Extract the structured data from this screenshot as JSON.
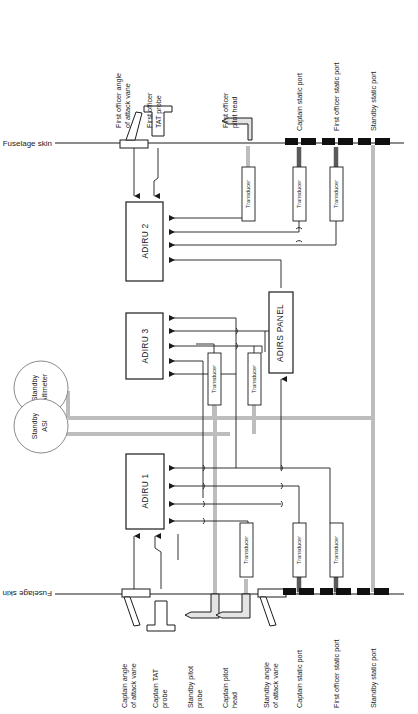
{
  "diagram": {
    "type": "block-schematic",
    "width": 418,
    "height": 714,
    "colors": {
      "line": "#1b1b1b",
      "pipe_gray": "#b8b8b8",
      "pipe_dark": "#5a5a5a",
      "port_black": "#101010",
      "background": "#ffffff"
    },
    "skin_label_top": "Fuselage skin",
    "skin_label_bottom": "Fuselage skin"
  },
  "units": [
    {
      "id": "adiru2",
      "label": "ADIRU 2",
      "x": 126,
      "y": 202,
      "w": 37,
      "h": 79
    },
    {
      "id": "adiru3",
      "label": "ADIRU 3",
      "x": 126,
      "y": 313,
      "w": 37,
      "h": 66
    },
    {
      "id": "adiru1",
      "label": "ADIRU 1",
      "x": 126,
      "y": 454,
      "w": 38,
      "h": 75
    },
    {
      "id": "adirs_panel",
      "label": "ADIRS PANEL",
      "x": 269,
      "y": 292,
      "w": 24,
      "h": 81
    }
  ],
  "standby_instruments": [
    {
      "id": "standby_altimeter",
      "line1": "Standby",
      "line2": "Altimeter",
      "cx": 41,
      "cy": 388,
      "r": 27
    },
    {
      "id": "standby_asi",
      "line1": "Standby",
      "line2": "ASI",
      "cx": 41,
      "cy": 426,
      "r": 27
    }
  ],
  "transducers": [
    {
      "id": "td_fo_pitot",
      "label": "Transducer",
      "x": 242,
      "y": 167,
      "w": 13,
      "h": 54
    },
    {
      "id": "td_capt_static_u",
      "label": "Transducer",
      "x": 293,
      "y": 167,
      "w": 13,
      "h": 54
    },
    {
      "id": "td_fo_static_u",
      "label": "Transducer",
      "x": 330,
      "y": 167,
      "w": 13,
      "h": 54
    },
    {
      "id": "td_mid_left",
      "label": "Transducer",
      "x": 208,
      "y": 353,
      "w": 13,
      "h": 52
    },
    {
      "id": "td_mid_right",
      "label": "Transducer",
      "x": 248,
      "y": 353,
      "w": 13,
      "h": 52
    },
    {
      "id": "td_capt_pitot_l",
      "label": "Transducer",
      "x": 240,
      "y": 523,
      "w": 13,
      "h": 54
    },
    {
      "id": "td_capt_static_l",
      "label": "Transducer",
      "x": 293,
      "y": 523,
      "w": 13,
      "h": 54
    },
    {
      "id": "td_fo_static_l",
      "label": "Transducer",
      "x": 330,
      "y": 523,
      "w": 13,
      "h": 54
    }
  ],
  "top_sensors": [
    {
      "id": "fo_aoa_vane",
      "line1": "First officer angle",
      "line2": "of attack vane",
      "lx": 121,
      "ly": 128,
      "two_line": true
    },
    {
      "id": "fo_tat_probe",
      "line1": "First officer",
      "line2": "TAT probe",
      "lx": 152,
      "ly": 128,
      "two_line": true
    },
    {
      "id": "fo_pitot_head",
      "line1": "First officer",
      "line2": "pitot head",
      "lx": 228,
      "ly": 128,
      "two_line": true
    },
    {
      "id": "capt_static_port_top",
      "line1": "Captain static port",
      "line2": "",
      "lx": 299,
      "ly": 128,
      "two_line": false
    },
    {
      "id": "fo_static_port_top",
      "line1": "First officer static port",
      "line2": "",
      "lx": 336,
      "ly": 128,
      "two_line": false
    },
    {
      "id": "standby_static_port_top",
      "line1": "Standby static port",
      "line2": "",
      "lx": 373,
      "ly": 128,
      "two_line": false
    }
  ],
  "bottom_sensors": [
    {
      "id": "capt_aoa_vane",
      "line1": "Captain angle",
      "line2": "of attack vane",
      "lx": 127,
      "ly": 612,
      "two_line": true
    },
    {
      "id": "capt_tat_probe",
      "line1": "Captain TAT",
      "line2": "probe",
      "lx": 158,
      "ly": 612,
      "two_line": true
    },
    {
      "id": "standby_pitot_probe",
      "line1": "Standby pitot",
      "line2": "probe",
      "lx": 193,
      "ly": 612,
      "two_line": true
    },
    {
      "id": "capt_pitot_head",
      "line1": "Captain pitot",
      "line2": "head",
      "lx": 228,
      "ly": 612,
      "two_line": true
    },
    {
      "id": "standby_aoa_vane",
      "line1": "Standby angle",
      "line2": "of attack vane",
      "lx": 269,
      "ly": 612,
      "two_line": true
    },
    {
      "id": "capt_static_port_bot",
      "line1": "Captain static port",
      "line2": "",
      "lx": 299,
      "ly": 612,
      "two_line": false
    },
    {
      "id": "fo_static_port_bot",
      "line1": "First officer static port",
      "line2": "",
      "lx": 336,
      "ly": 612,
      "two_line": false
    },
    {
      "id": "standby_static_port_bot",
      "line1": "Standby static port",
      "line2": "",
      "lx": 373,
      "ly": 612,
      "two_line": false
    }
  ],
  "geometry": {
    "skin_top_y": 143,
    "skin_bottom_y": 594,
    "skin_x_start": 93,
    "skin_x_end": 404,
    "bus_y_1": 418,
    "bus_y_2": 434
  }
}
